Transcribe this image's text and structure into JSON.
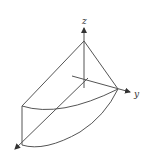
{
  "diagram": {
    "axes": {
      "x_label": "x",
      "y_label": "y",
      "z_label": "z"
    },
    "colors": {
      "line": "#555555",
      "background": "#ffffff"
    }
  }
}
